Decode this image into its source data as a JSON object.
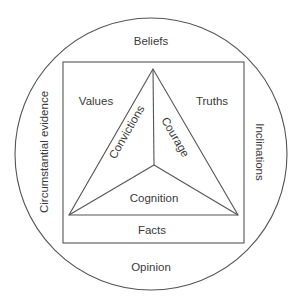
{
  "diagram": {
    "outer_circle": {
      "top": "Beliefs",
      "bottom": "Opinion",
      "left": "Circumstantial evidence",
      "right": "Inclinations"
    },
    "rectangle": {
      "top_left": "Values",
      "top_right": "Truths",
      "bottom": "Facts"
    },
    "triangle": {
      "left_segment": "Convictions",
      "right_segment": "Courage",
      "bottom_segment": "Cognition"
    },
    "colors": {
      "line": "#555555",
      "text": "#3a3a3a",
      "background": "#ffffff"
    }
  }
}
